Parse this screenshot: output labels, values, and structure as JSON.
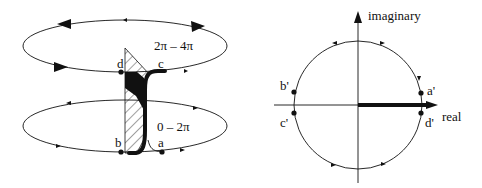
{
  "left_diagram": {
    "upper_loop_label": "2π – 4π",
    "lower_loop_label": "0 – 2π",
    "points": {
      "a": "a",
      "b": "b",
      "c": "c",
      "d": "d"
    }
  },
  "right_diagram": {
    "y_axis_label": "imaginary",
    "x_axis_label": "real",
    "points": {
      "a_prime": "a'",
      "b_prime": "b'",
      "c_prime": "c'",
      "d_prime": "d'"
    }
  },
  "colors": {
    "stroke": "#111111",
    "background": "#ffffff"
  }
}
